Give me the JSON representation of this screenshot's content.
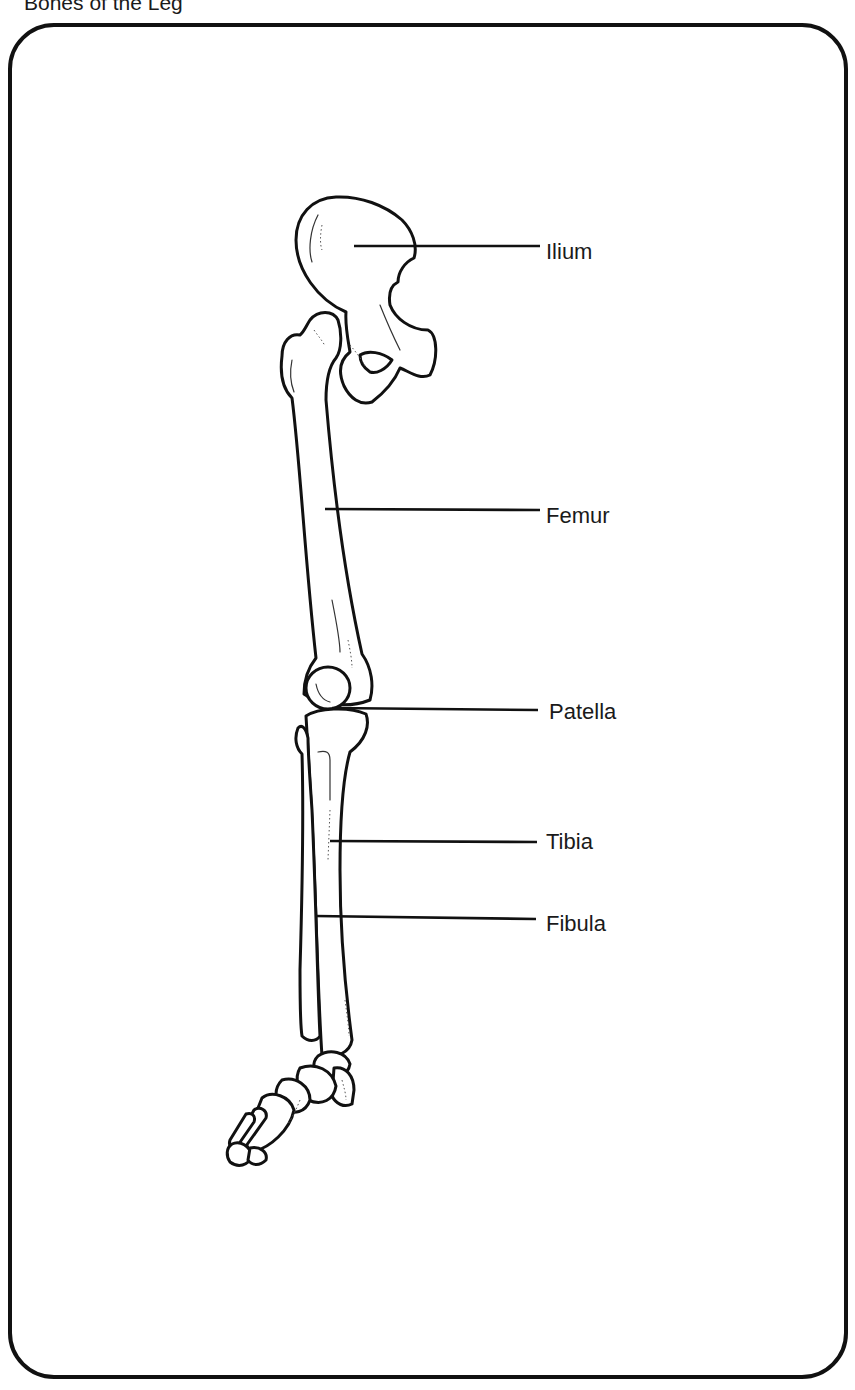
{
  "title": "Bones of the Leg",
  "diagram": {
    "type": "anatomical-labeled-illustration",
    "labels": [
      {
        "id": "ilium",
        "text": "Ilium",
        "x": 546,
        "y": 239
      },
      {
        "id": "femur",
        "text": "Femur",
        "x": 546,
        "y": 503
      },
      {
        "id": "patella",
        "text": "Patella",
        "x": 549,
        "y": 699
      },
      {
        "id": "tibia",
        "text": "Tibia",
        "x": 546,
        "y": 829
      },
      {
        "id": "fibula",
        "text": "Fibula",
        "x": 546,
        "y": 911
      }
    ],
    "colors": {
      "stroke": "#111111",
      "background": "#ffffff",
      "text": "#1a1a1a"
    }
  }
}
